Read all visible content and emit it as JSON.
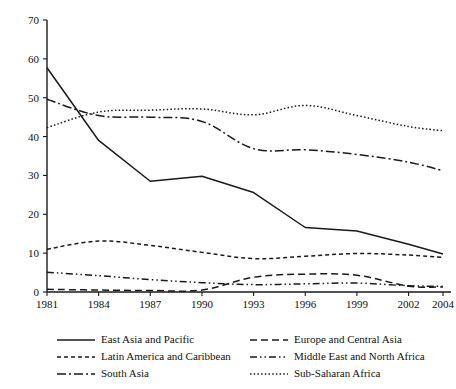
{
  "chart_data": {
    "type": "line",
    "title": "",
    "subtitle": "",
    "xlabel": "",
    "ylabel": "",
    "x": [
      1981,
      1984,
      1987,
      1990,
      1993,
      1996,
      1999,
      2002,
      2004
    ],
    "xtick_labels": [
      "1981",
      "1984",
      "1987",
      "1990",
      "1993",
      "1996",
      "1999",
      "2002",
      "2004"
    ],
    "ytick_labels": [
      "0",
      "10",
      "20",
      "30",
      "40",
      "50",
      "60",
      "70"
    ],
    "ytick_values": [
      0,
      10,
      20,
      30,
      40,
      50,
      60,
      70
    ],
    "xlim": [
      1981,
      2004
    ],
    "ylim": [
      0,
      70
    ],
    "grid": false,
    "legend_position": "below",
    "series": [
      {
        "name": "East Asia and Pacific",
        "style": "solid",
        "dash": "none",
        "values": [
          57.7,
          39.0,
          28.5,
          29.8,
          25.6,
          16.6,
          15.7,
          12.3,
          9.8
        ]
      },
      {
        "name": "Europe and Central Asia",
        "style": "long-dash",
        "dash": "7,4",
        "values": [
          0.7,
          0.5,
          0.4,
          0.5,
          3.8,
          4.6,
          4.3,
          1.5,
          1.3
        ]
      },
      {
        "name": "Latin America and Caribbean",
        "style": "short-dash",
        "dash": "4,3",
        "values": [
          11.0,
          13.1,
          12.0,
          10.2,
          8.6,
          9.2,
          9.9,
          9.5,
          8.9
        ]
      },
      {
        "name": "Middle East and North Africa",
        "style": "dash-dot-dot",
        "dash": "7,3,1.5,3,1.5,3",
        "values": [
          5.1,
          4.2,
          3.2,
          2.4,
          1.9,
          2.1,
          2.3,
          1.6,
          1.5
        ]
      },
      {
        "name": "South Asia",
        "style": "dash-dot",
        "dash": "9,3,2,3",
        "values": [
          49.6,
          45.4,
          45.0,
          43.9,
          36.9,
          36.6,
          35.4,
          33.4,
          31.2
        ]
      },
      {
        "name": "Sub-Saharan Africa",
        "style": "dotted",
        "dash": "1.5,2.2",
        "values": [
          42.3,
          46.3,
          46.8,
          47.1,
          45.6,
          48.0,
          45.4,
          42.6,
          41.5
        ]
      }
    ],
    "legend": [
      {
        "label": "East Asia and Pacific",
        "dash": "none"
      },
      {
        "label": "Europe and Central Asia",
        "dash": "7,4"
      },
      {
        "label": "Latin America and Caribbean",
        "dash": "4,3"
      },
      {
        "label": "Middle East and North Africa",
        "dash": "7,3,1.5,3,1.5,3"
      },
      {
        "label": "South Asia",
        "dash": "9,3,2,3"
      },
      {
        "label": "Sub-Saharan Africa",
        "dash": "1.5,2.2"
      }
    ],
    "colors": {
      "ink": "#1a1a1a",
      "background": "#ffffff"
    }
  }
}
